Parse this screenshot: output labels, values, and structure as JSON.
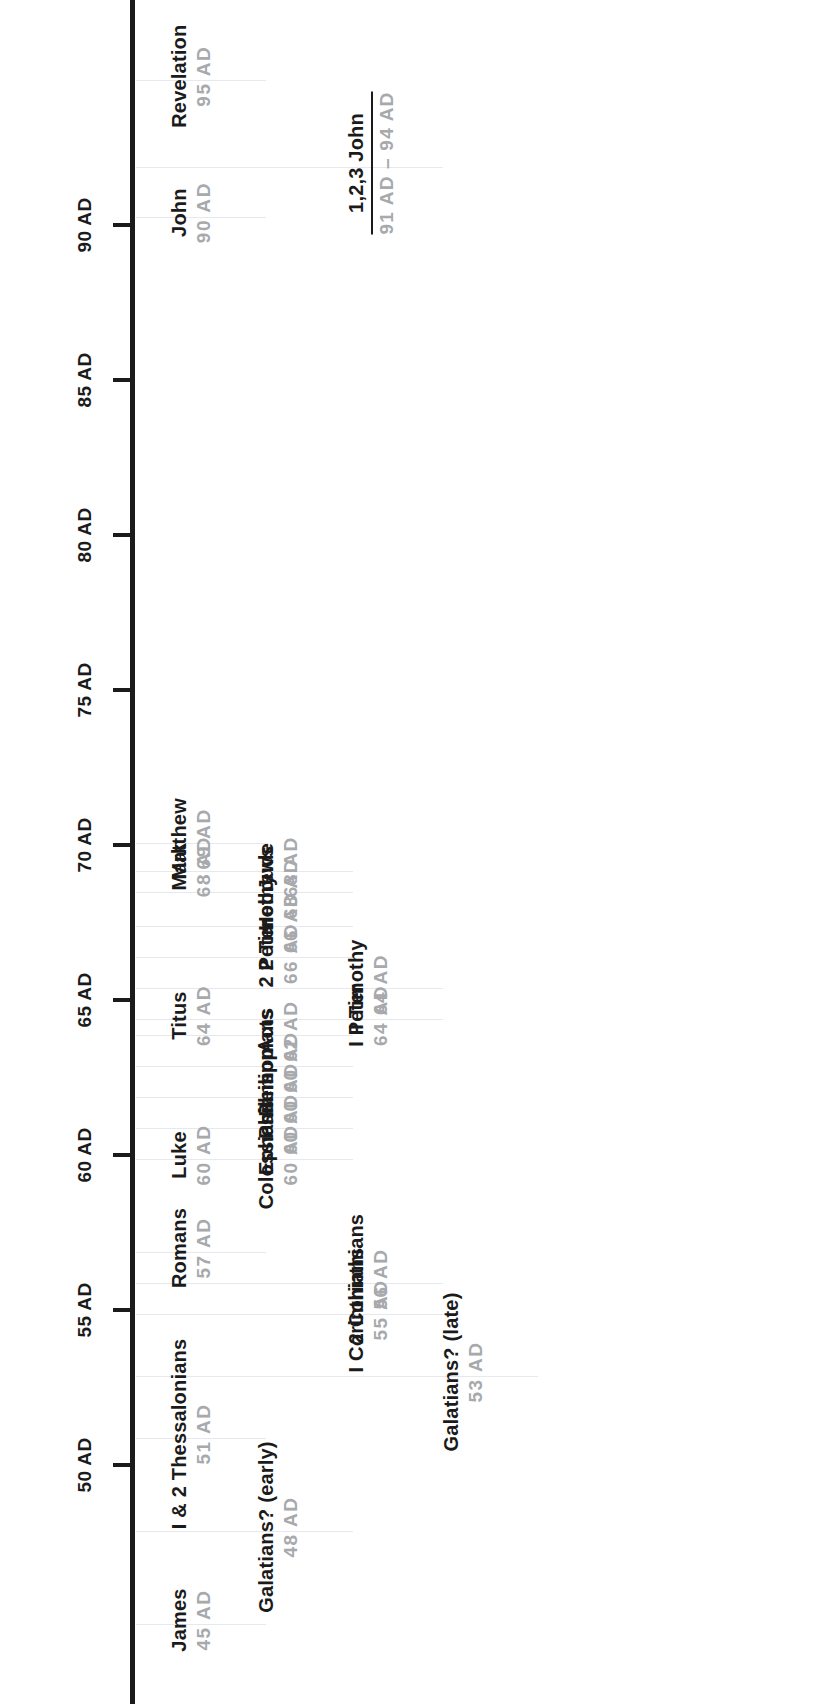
{
  "axis": {
    "unit_suffix": "AD",
    "ticks": [
      {
        "year": 50,
        "label": "50 AD"
      },
      {
        "year": 55,
        "label": "55 AD"
      },
      {
        "year": 60,
        "label": "60 AD"
      },
      {
        "year": 65,
        "label": "65 AD"
      },
      {
        "year": 70,
        "label": "70 AD"
      },
      {
        "year": 75,
        "label": "75 AD"
      },
      {
        "year": 80,
        "label": "80 AD"
      },
      {
        "year": 85,
        "label": "85 AD"
      },
      {
        "year": 90,
        "label": "90 AD"
      }
    ],
    "range": [
      43,
      97
    ],
    "color": "#1b1b1b"
  },
  "colors": {
    "book_text": "#1b1b1b",
    "date_text": "#a7a9ac",
    "leader_line": "#e6e8ee",
    "background": "#ffffff"
  },
  "entries": [
    {
      "book": "James",
      "date": "45 AD",
      "year": 45,
      "lane": 0,
      "ranged": false
    },
    {
      "book": "Galatians? (early)",
      "date": "48 AD",
      "year": 48,
      "lane": 1,
      "ranged": false
    },
    {
      "book": "I & 2 Thessalonians",
      "date": "51 AD",
      "year": 51,
      "lane": 0,
      "ranged": false
    },
    {
      "book": "Galatians? (late)",
      "date": "53 AD",
      "year": 53,
      "lane": 3,
      "ranged": false
    },
    {
      "book": "I Corinthians",
      "date": "55 AD",
      "year": 55,
      "lane": 2,
      "ranged": false
    },
    {
      "book": "2 Corinthians",
      "date": "56 AD",
      "year": 56,
      "lane": 2,
      "ranged": false
    },
    {
      "book": "Romans",
      "date": "57 AD",
      "year": 57,
      "lane": 0,
      "ranged": false
    },
    {
      "book": "Colossians",
      "date": "60 AD",
      "year": 60,
      "lane": 1,
      "ranged": false
    },
    {
      "book": "Ephesians",
      "date": "60 AD",
      "year": 61,
      "lane": 1,
      "ranged": false
    },
    {
      "book": "Philemon",
      "date": "60 AD",
      "year": 62,
      "lane": 1,
      "ranged": false
    },
    {
      "book": "Philippians",
      "date": "60 AD",
      "year": 63,
      "lane": 1,
      "ranged": false
    },
    {
      "book": "Luke",
      "date": "60 AD",
      "year": 60,
      "lane": 0,
      "ranged": false
    },
    {
      "book": "Acts",
      "date": "62 AD",
      "year": 64,
      "lane": 1,
      "ranged": false
    },
    {
      "book": "Titus",
      "date": "64 AD",
      "year": 64.5,
      "lane": 0,
      "ranged": false
    },
    {
      "book": "I Peter",
      "date": "64 AD",
      "year": 64.5,
      "lane": 2,
      "ranged": false
    },
    {
      "book": "I Timothy",
      "date": "64 AD",
      "year": 65.5,
      "lane": 2,
      "ranged": false
    },
    {
      "book": "2 Peter",
      "date": "66 AD",
      "year": 66.5,
      "lane": 1,
      "ranged": false
    },
    {
      "book": "2 Timothy",
      "date": "66 AD",
      "year": 67.5,
      "lane": 1,
      "ranged": false
    },
    {
      "book": "Hebrews",
      "date": "68 AD",
      "year": 68.6,
      "lane": 1,
      "ranged": false
    },
    {
      "book": "Jude",
      "date": "68 AD",
      "year": 69.3,
      "lane": 1,
      "ranged": false
    },
    {
      "book": "Mark",
      "date": "68 AD",
      "year": 69.3,
      "lane": 0,
      "ranged": false
    },
    {
      "book": "Matthew",
      "date": "69 AD",
      "year": 70.2,
      "lane": 0,
      "ranged": false
    },
    {
      "book": "John",
      "date": "90 AD",
      "year": 90.4,
      "lane": 0,
      "ranged": false
    },
    {
      "book": "1,2,3 John",
      "date": "91 AD – 94 AD",
      "year": 92.0,
      "lane": 2,
      "ranged": true
    },
    {
      "book": "Revelation",
      "date": "95 AD",
      "year": 94.8,
      "lane": 0,
      "ranged": false
    }
  ]
}
